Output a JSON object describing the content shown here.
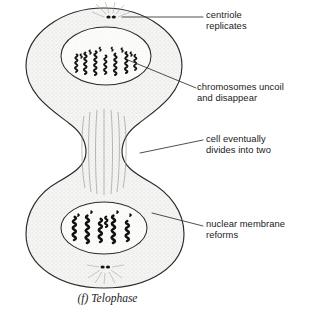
{
  "figure": {
    "caption": "(f) Telophase",
    "phase_letter": "(f)",
    "phase_name": "Telophase"
  },
  "colors": {
    "ink": "#1a1a1a",
    "outline": "#2b2b2b",
    "cytoplasm": "#f4f4f2",
    "nucleoplasm": "#fbfbfa",
    "chromosome": "#121212",
    "leader": "#303030",
    "background": "#ffffff"
  },
  "labels": [
    {
      "id": "centriole-replicates",
      "text": "centriole\nreplicates",
      "line1": "centriole",
      "line2": "replicates",
      "x": 206,
      "y": 10,
      "leader": {
        "x1": 122,
        "y1": 17,
        "x2": 203,
        "y2": 17
      },
      "points_at": "centriole-pair-top"
    },
    {
      "id": "chromosomes-uncoil-and-disappear",
      "text": "chromosomes uncoil\nand disappear",
      "line1": "chromosomes uncoil",
      "line2": "and disappear",
      "x": 197,
      "y": 82,
      "leader": {
        "x1": 128,
        "y1": 60,
        "x2": 196,
        "y2": 88
      },
      "points_at": "chromosomes-top"
    },
    {
      "id": "cell-eventually-divides-into-two",
      "text": "cell eventually\ndivides into two",
      "line1": "cell eventually",
      "line2": "divides into two",
      "x": 206,
      "y": 134,
      "leader": {
        "x1": 140,
        "y1": 153,
        "x2": 203,
        "y2": 140
      },
      "points_at": "cleavage-furrow"
    },
    {
      "id": "nuclear-membrane-reforms",
      "text": "nuclear membrane\nreforms",
      "line1": "nuclear membrane",
      "line2": "reforms",
      "x": 206,
      "y": 219,
      "leader": {
        "x1": 152,
        "y1": 213,
        "x2": 203,
        "y2": 226
      },
      "points_at": "nuclear-envelope-bottom"
    }
  ],
  "structures": {
    "cell_membrane": "hourglass-shaped dividing cell outline",
    "cleavage_furrow": "constriction at cell midline",
    "spindle_fibers": "vertical fibers spanning the furrow",
    "nucleus_top": "upper daughter nucleus",
    "nucleus_bottom": "lower daughter nucleus",
    "centriole_top": "pair of dots above upper nucleus",
    "centriole_bottom": "pair of dots below lower nucleus",
    "astral_rays_top": "radiating lines from upper centriole",
    "astral_rays_bottom": "radiating lines from lower centriole",
    "chromosomes_top": "uncoiling squiggly chromosomes in upper nucleus",
    "chromosomes_bottom": "coiled chromosomes in lower nucleus"
  }
}
